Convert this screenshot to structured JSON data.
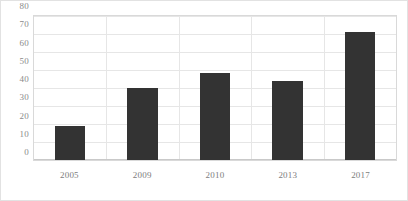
{
  "chart_data": {
    "type": "bar",
    "title": "",
    "subtitle": "",
    "xlabel": "",
    "ylabel": "",
    "categories": [
      "2005",
      "2009",
      "2010",
      "2013",
      "2017"
    ],
    "values": [
      19,
      40,
      48.5,
      44,
      71
    ],
    "series": [
      {
        "name": "",
        "values": [
          19,
          40,
          48.5,
          44,
          71
        ]
      }
    ],
    "ylim": [
      0,
      80
    ],
    "yticks": [
      0,
      10,
      20,
      30,
      40,
      50,
      60,
      70,
      80
    ],
    "ytick_labels": [
      "0",
      "10",
      "20",
      "30",
      "40",
      "50",
      "60",
      "70",
      "80"
    ],
    "grid": {
      "horizontal": true,
      "vertical": true
    },
    "legend": {
      "visible": false,
      "position": "none",
      "entries": []
    },
    "annotations": [],
    "colors": {
      "bar": "#333333",
      "gridline": "#e6e6e6",
      "plot_border": "#d9d9d9",
      "figure_border": "#e2e2e2",
      "tick_label": "#8a8a8a",
      "background": "#ffffff"
    }
  }
}
